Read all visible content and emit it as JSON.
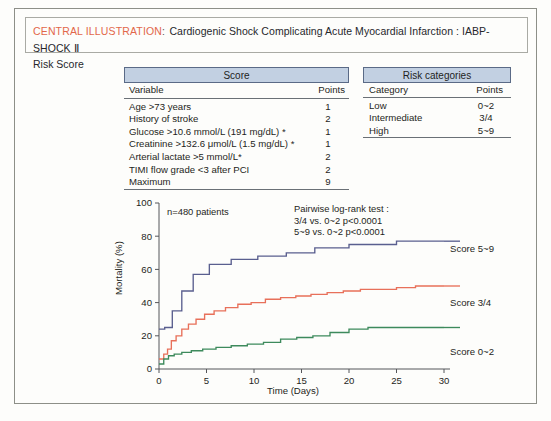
{
  "title": {
    "accent": "CENTRAL ILLUSTRATION",
    "separator": ":",
    "main": "Cardiogenic Shock Complicating Acute Myocardial Infarction : IABP-SHOCK Ⅱ",
    "line2": "Risk Score",
    "accent_color": "#e2674a"
  },
  "score_table": {
    "header": "Score",
    "col_variable": "Variable",
    "col_points": "Points",
    "rows": [
      {
        "variable": "Age >73 years",
        "points": "1"
      },
      {
        "variable": "History of stroke",
        "points": "2"
      },
      {
        "variable": "Glucose >10.6 mmol/L  (191 mg/dL) *",
        "points": "1"
      },
      {
        "variable": "Creatinine >132.6 μmol/L  (1.5 mg/dL) *",
        "points": "1"
      },
      {
        "variable": "Arterial lactate >5 mmol/L*",
        "points": "2"
      },
      {
        "variable": "TIMI flow grade <3 after PCI",
        "points": "2"
      },
      {
        "variable": "Maximum",
        "points": "9"
      }
    ]
  },
  "risk_table": {
    "header": "Risk categories",
    "col_category": "Category",
    "col_points": "Points",
    "rows": [
      {
        "category": "Low",
        "points": "0~2"
      },
      {
        "category": "Intermediate",
        "points": "3/4"
      },
      {
        "category": "High",
        "points": "5~9"
      }
    ]
  },
  "chart_data": {
    "type": "line",
    "title": "",
    "xlabel": "Time (Days)",
    "ylabel": "Mortality (%)",
    "xlim": [
      0,
      30
    ],
    "ylim": [
      0,
      100
    ],
    "xticks": [
      0,
      5,
      10,
      15,
      20,
      25,
      30
    ],
    "yticks": [
      0,
      20,
      40,
      60,
      80,
      100
    ],
    "grid": false,
    "legend_position": "right",
    "annotations": {
      "n_patients": "n=480 patients",
      "pairwise_title": "Pairwise log-rank test :",
      "pairwise_line1": "3/4 vs. 0~2 p<0.0001",
      "pairwise_line2": "5~9 vs. 0~2 p<0.0001"
    },
    "series": [
      {
        "name": "Score 5~9",
        "color": "#5a5f8f",
        "x": [
          0,
          0.6,
          1.0,
          1.4,
          1.9,
          2.4,
          3.0,
          3.6,
          4.4,
          5.3,
          6.3,
          7.6,
          9.0,
          10.4,
          12.0,
          13.4,
          15.0,
          16.4,
          18.0,
          20.0,
          22.0,
          25.0,
          27.5,
          30.0
        ],
        "y": [
          24,
          25,
          25,
          35,
          35,
          47,
          47,
          57,
          57,
          63,
          63,
          66,
          66,
          68,
          68,
          70,
          70,
          73,
          73,
          75,
          75,
          77,
          77,
          77
        ]
      },
      {
        "name": "Score 3/4",
        "color": "#e8705a",
        "x": [
          0,
          0.5,
          0.9,
          1.3,
          1.8,
          2.4,
          3.1,
          3.9,
          4.8,
          5.8,
          7.0,
          8.3,
          9.7,
          11.2,
          12.8,
          14.4,
          16.0,
          17.7,
          19.4,
          21.2,
          23.0,
          25.0,
          27.0,
          29.0,
          30.0
        ],
        "y": [
          6,
          9,
          12,
          17,
          20,
          24,
          27,
          30,
          33,
          35,
          37,
          39,
          40,
          42,
          43,
          44,
          45,
          46,
          47,
          48,
          48,
          49,
          50,
          50,
          50
        ]
      },
      {
        "name": "Score 0~2",
        "color": "#3d8a5c",
        "x": [
          0,
          0.5,
          1.0,
          1.6,
          2.4,
          3.4,
          4.6,
          6.0,
          7.6,
          9.3,
          11.0,
          12.8,
          14.5,
          16.2,
          18.0,
          20.0,
          22.0,
          24.0,
          26.0,
          28.0,
          30.0
        ],
        "y": [
          3,
          6,
          8,
          9,
          10,
          11,
          12,
          13,
          14,
          15,
          16,
          18,
          19,
          20,
          22,
          24,
          25,
          25,
          25,
          25,
          25
        ]
      }
    ]
  }
}
